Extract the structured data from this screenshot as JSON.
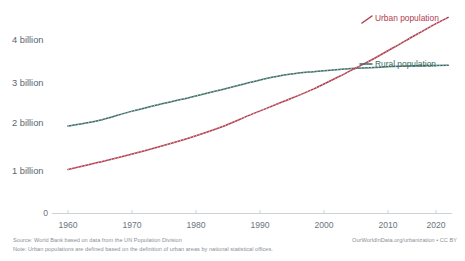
{
  "chart_data": {
    "type": "line",
    "title": "",
    "xlabel": "",
    "ylabel": "",
    "xlim": [
      1958,
      2022
    ],
    "ylim": [
      0,
      4600000000
    ],
    "grid": false,
    "legend_position": "right-inline",
    "x_ticks": [
      "1960",
      "1970",
      "1980",
      "1990",
      "2000",
      "2010",
      "2020"
    ],
    "x_tick_values": [
      1960,
      1970,
      1980,
      1990,
      2000,
      2010,
      2020
    ],
    "y_ticks": [
      "0",
      "1 billion",
      "2 billion",
      "3 billion",
      "4 billion"
    ],
    "y_tick_values": [
      0,
      1000000000,
      2000000000,
      3000000000,
      4000000000
    ],
    "x": [
      1960,
      1965,
      1970,
      1975,
      1980,
      1985,
      1990,
      1995,
      2000,
      2005,
      2007,
      2010,
      2015,
      2020,
      2022
    ],
    "series": [
      {
        "name": "Urban population",
        "color": "#b13c4e",
        "label": "Urban population",
        "values": [
          1013000000,
          1180000000,
          1354000000,
          1546000000,
          1754000000,
          1995000000,
          2290000000,
          2575000000,
          2869000000,
          3215000000,
          3360000000,
          3580000000,
          3981000000,
          4378000000,
          4520000000
        ]
      },
      {
        "name": "Rural population",
        "color": "#3b6b63",
        "label": "Rural population",
        "values": [
          2016000000,
          2145000000,
          2343000000,
          2520000000,
          2682000000,
          2855000000,
          3031000000,
          3185000000,
          3270000000,
          3330000000,
          3350000000,
          3368000000,
          3400000000,
          3412000000,
          3415000000
        ]
      }
    ],
    "annotations": [
      "Urban and rural population curves cross at approximately 2007 near 3.35 billion"
    ]
  },
  "legend": {
    "urban_label": "Urban population",
    "rural_label": "Rural population",
    "urban_color": "#b13c4e",
    "rural_color": "#3b6b63"
  },
  "axis": {
    "y_labels": [
      "4 billion",
      "3 billion",
      "2 billion",
      "1 billion"
    ],
    "zero_label": "0",
    "x_labels": [
      "1960",
      "1970",
      "1980",
      "1990",
      "2000",
      "2010",
      "2020"
    ]
  },
  "footer": {
    "source": "Source: World Bank based on data from the UN Population Division",
    "note": "Note: Urban populations are defined based on the definition of urban areas by national statistical offices.",
    "credit": "OurWorldInData.org/urbanization • CC BY"
  }
}
